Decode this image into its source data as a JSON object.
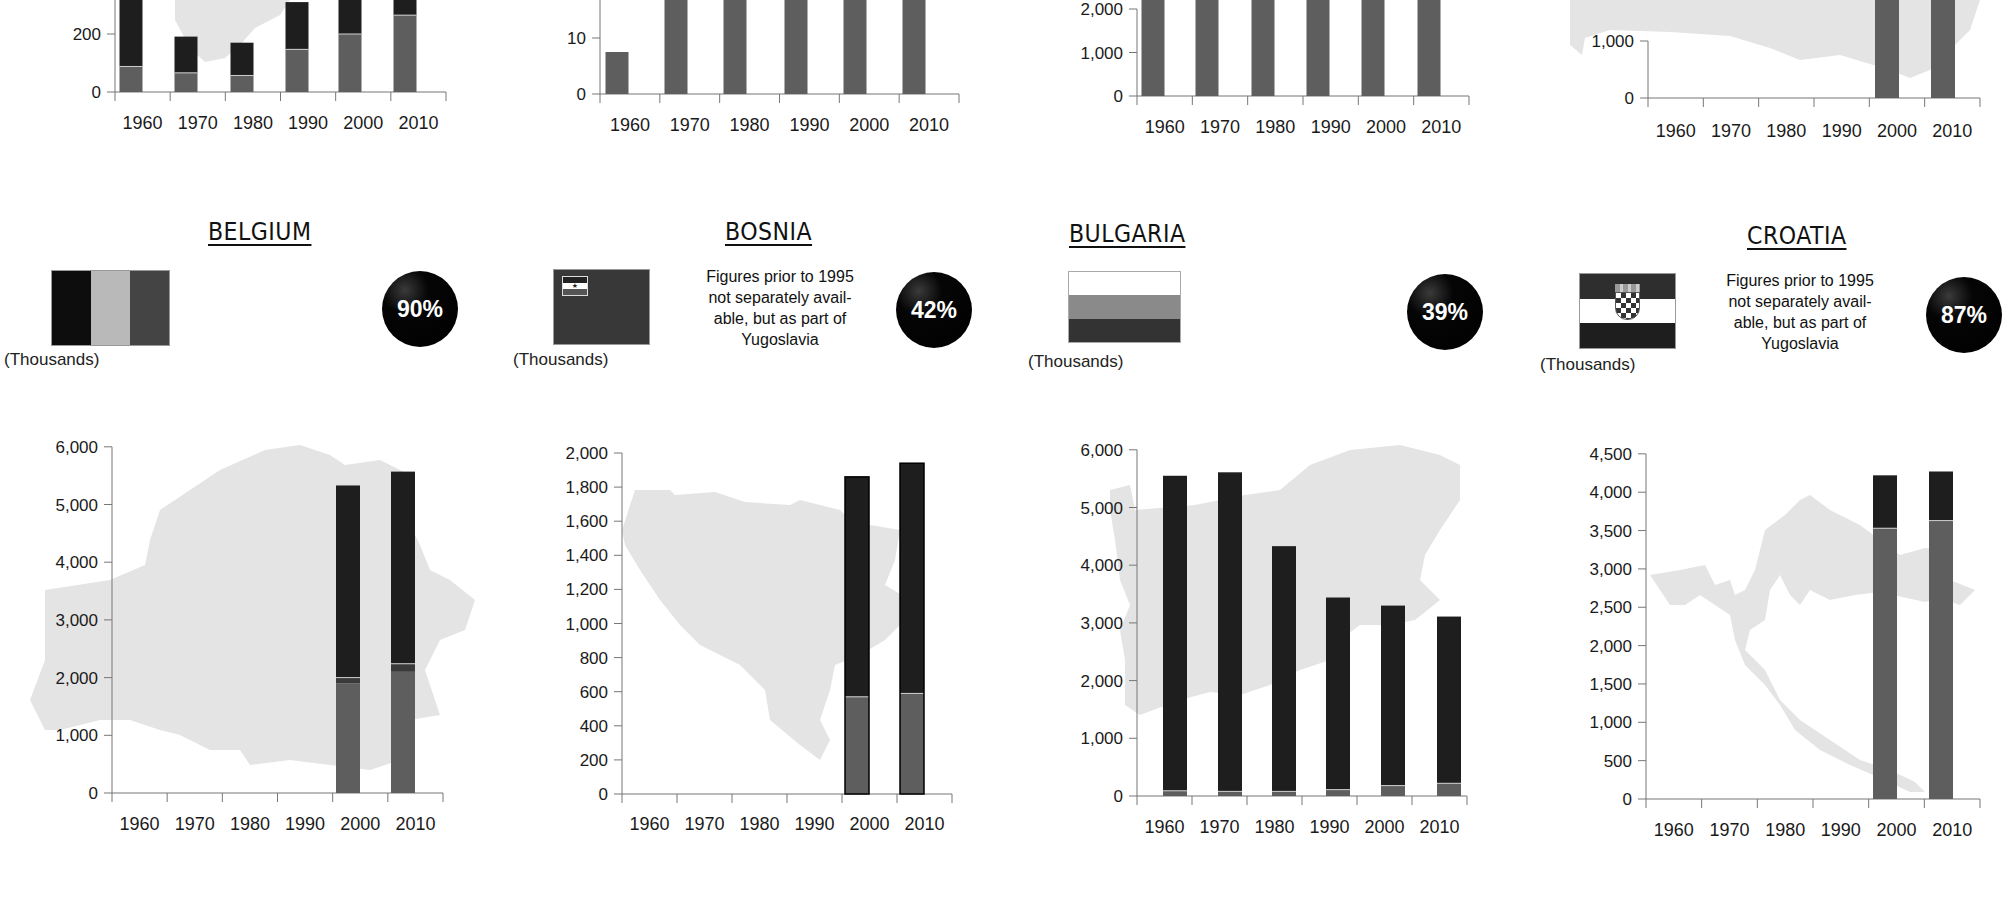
{
  "countries": [
    {
      "name": "BELGIUM",
      "units": "(Thousands)",
      "note": "",
      "percent": "90%",
      "flag": "belgium"
    },
    {
      "name": "BOSNIA",
      "units": "(Thousands)",
      "note": "Figures prior to 1995 not separately avail-able, but as part of Yugoslavia",
      "note_lines": [
        "Figures prior to 1995",
        "not separately avail-",
        "able, but as part of",
        "Yugoslavia"
      ],
      "percent": "42%",
      "flag": "bosnia"
    },
    {
      "name": "BULGARIA",
      "units": "(Thousands)",
      "note": "",
      "percent": "39%",
      "flag": "bulgaria"
    },
    {
      "name": "CROATIA",
      "units": "(Thousands)",
      "note": "Figures prior to 1995 not separately avail-able, but as part of Yugoslavia",
      "note_lines": [
        "Figures prior to 1995",
        "not separately avail-",
        "able, but as part of",
        "Yugoslavia"
      ],
      "percent": "87%",
      "flag": "croatia"
    }
  ],
  "colors": {
    "dark_segment": "#1e1e1e",
    "mid_segment": "#5e5e5e",
    "map_silhouette": "#e4e4e4",
    "axis": "#777777",
    "percent_circle": "#000000"
  },
  "chart_data": [
    {
      "type": "bar",
      "title": "(top row, cropped) chart 1",
      "categories": [
        "1960",
        "1970",
        "1980",
        "1990",
        "2000",
        "2010"
      ],
      "stacked": true,
      "visible_yticks": [
        "0",
        "200"
      ],
      "series": [
        {
          "name": "lower (mid gray)",
          "values": [
            88,
            66,
            57,
            147,
            200,
            265
          ]
        },
        {
          "name": "upper (dark)",
          "values": [
            260,
            125,
            113,
            163,
            200,
            100
          ]
        }
      ],
      "ylim": [
        0,
        320
      ],
      "note": "top of chart cropped; 1960, 2000, 2010 totals exceed visible area"
    },
    {
      "type": "bar",
      "title": "(top row, cropped) chart 2",
      "categories": [
        "1960",
        "1970",
        "1980",
        "1990",
        "2000",
        "2010"
      ],
      "visible_yticks": [
        "0",
        "10",
        "20"
      ],
      "series": [
        {
          "name": "total",
          "values": [
            7.5,
            18,
            25,
            25,
            25,
            25
          ]
        }
      ],
      "ylim": [
        0,
        20
      ],
      "note": "top of chart cropped; 1980-2010 exceed visible area"
    },
    {
      "type": "bar",
      "title": "(top row, cropped) chart 3",
      "categories": [
        "1960",
        "1970",
        "1980",
        "1990",
        "2000",
        "2010"
      ],
      "visible_yticks": [
        "0",
        "1,000",
        "2,000"
      ],
      "series": [
        {
          "name": "total",
          "values": [
            2500,
            2500,
            2500,
            2500,
            2500,
            2500
          ]
        }
      ],
      "ylim": [
        0,
        2000
      ],
      "note": "top of chart cropped; all bars exceed visible area"
    },
    {
      "type": "bar",
      "title": "(top row, cropped) chart 4",
      "categories": [
        "1960",
        "1970",
        "1980",
        "1990",
        "2000",
        "2010"
      ],
      "visible_yticks": [
        "0",
        "1,000"
      ],
      "series": [
        {
          "name": "total",
          "values": [
            0,
            0,
            0,
            0,
            2000,
            2000
          ]
        }
      ],
      "ylim": [
        0,
        1000
      ],
      "note": "top of chart cropped; only 2000 and 2010 bars shown"
    },
    {
      "type": "bar",
      "title": "BELGIUM",
      "ylabel": "(Thousands)",
      "categories": [
        "1960",
        "1970",
        "1980",
        "1990",
        "2000",
        "2010"
      ],
      "yticks": [
        "0",
        "1,000",
        "2,000",
        "3,000",
        "4,000",
        "5,000",
        "6,000"
      ],
      "ylim": [
        0,
        6000
      ],
      "stacked": true,
      "series": [
        {
          "name": "lower (mid gray)",
          "values": [
            null,
            null,
            null,
            null,
            1900,
            2100
          ]
        },
        {
          "name": "thin band",
          "values": [
            null,
            null,
            null,
            null,
            100,
            140
          ]
        },
        {
          "name": "upper (dark)",
          "values": [
            null,
            null,
            null,
            null,
            3330,
            3330
          ]
        }
      ],
      "totals": [
        null,
        null,
        null,
        null,
        5330,
        5570
      ],
      "badge": "90%"
    },
    {
      "type": "bar",
      "title": "BOSNIA",
      "ylabel": "(Thousands)",
      "categories": [
        "1960",
        "1970",
        "1980",
        "1990",
        "2000",
        "2010"
      ],
      "yticks": [
        "0",
        "200",
        "400",
        "600",
        "800",
        "1,000",
        "1,200",
        "1,400",
        "1,600",
        "1,800",
        "2,000"
      ],
      "ylim": [
        0,
        2000
      ],
      "stacked": true,
      "series": [
        {
          "name": "lower (mid gray)",
          "values": [
            null,
            null,
            null,
            null,
            570,
            590
          ]
        },
        {
          "name": "upper (dark)",
          "values": [
            null,
            null,
            null,
            null,
            1290,
            1350
          ]
        }
      ],
      "totals": [
        null,
        null,
        null,
        null,
        1860,
        1940
      ],
      "annotation": "Figures prior to 1995 not separately available, but as part of Yugoslavia",
      "badge": "42%"
    },
    {
      "type": "bar",
      "title": "BULGARIA",
      "ylabel": "(Thousands)",
      "categories": [
        "1960",
        "1970",
        "1980",
        "1990",
        "2000",
        "2010"
      ],
      "yticks": [
        "0",
        "1,000",
        "2,000",
        "3,000",
        "4,000",
        "5,000",
        "6,000"
      ],
      "ylim": [
        0,
        6000
      ],
      "stacked": true,
      "series": [
        {
          "name": "lower (mid gray)",
          "values": [
            90,
            80,
            80,
            110,
            180,
            220
          ]
        },
        {
          "name": "upper (dark)",
          "values": [
            5460,
            5530,
            4250,
            3330,
            3120,
            2890
          ]
        }
      ],
      "totals": [
        5550,
        5610,
        4330,
        3440,
        3300,
        3110
      ],
      "badge": "39%"
    },
    {
      "type": "bar",
      "title": "CROATIA",
      "ylabel": "(Thousands)",
      "categories": [
        "1960",
        "1970",
        "1980",
        "1990",
        "2000",
        "2010"
      ],
      "yticks": [
        "0",
        "500",
        "1,000",
        "1,500",
        "2,000",
        "2,500",
        "3,000",
        "3,500",
        "4,000",
        "4,500"
      ],
      "ylim": [
        0,
        4500
      ],
      "stacked": true,
      "series": [
        {
          "name": "lower (mid gray)",
          "values": [
            null,
            null,
            null,
            null,
            3530,
            3630
          ]
        },
        {
          "name": "upper (dark)",
          "values": [
            null,
            null,
            null,
            null,
            690,
            640
          ]
        }
      ],
      "totals": [
        null,
        null,
        null,
        null,
        4220,
        4270
      ],
      "annotation": "Figures prior to 1995 not separately available, but as part of Yugoslavia",
      "badge": "87%"
    }
  ]
}
